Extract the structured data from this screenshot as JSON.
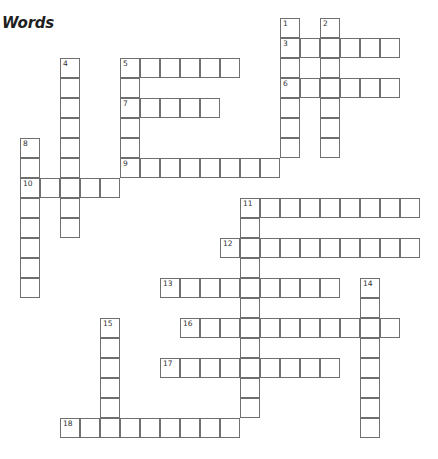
{
  "title": "Words",
  "entries": [
    {
      "number": 1,
      "direction": "down",
      "row": 0,
      "col": 13,
      "length": 7
    },
    {
      "number": 2,
      "direction": "down",
      "row": 0,
      "col": 15,
      "length": 7
    },
    {
      "number": 3,
      "direction": "across",
      "row": 1,
      "col": 13,
      "length": 6
    },
    {
      "number": 4,
      "direction": "down",
      "row": 2,
      "col": 2,
      "length": 9
    },
    {
      "number": 5,
      "direction": "across",
      "row": 2,
      "col": 5,
      "length": 6
    },
    {
      "number": 5,
      "direction": "down",
      "row": 2,
      "col": 5,
      "length": 6
    },
    {
      "number": 6,
      "direction": "across",
      "row": 3,
      "col": 13,
      "length": 6
    },
    {
      "number": 7,
      "direction": "across",
      "row": 4,
      "col": 5,
      "length": 5
    },
    {
      "number": 8,
      "direction": "down",
      "row": 6,
      "col": 0,
      "length": 8
    },
    {
      "number": 9,
      "direction": "across",
      "row": 7,
      "col": 5,
      "length": 8
    },
    {
      "number": 10,
      "direction": "across",
      "row": 8,
      "col": 0,
      "length": 5
    },
    {
      "number": 11,
      "direction": "across",
      "row": 9,
      "col": 11,
      "length": 9
    },
    {
      "number": 11,
      "direction": "down",
      "row": 9,
      "col": 11,
      "length": 11
    },
    {
      "number": 12,
      "direction": "across",
      "row": 11,
      "col": 10,
      "length": 10
    },
    {
      "number": 13,
      "direction": "across",
      "row": 13,
      "col": 7,
      "length": 9
    },
    {
      "number": 14,
      "direction": "down",
      "row": 13,
      "col": 17,
      "length": 8
    },
    {
      "number": 15,
      "direction": "down",
      "row": 15,
      "col": 4,
      "length": 6
    },
    {
      "number": 16,
      "direction": "across",
      "row": 15,
      "col": 8,
      "length": 11
    },
    {
      "number": 17,
      "direction": "across",
      "row": 17,
      "col": 7,
      "length": 9
    },
    {
      "number": 18,
      "direction": "across",
      "row": 20,
      "col": 2,
      "length": 9
    }
  ]
}
